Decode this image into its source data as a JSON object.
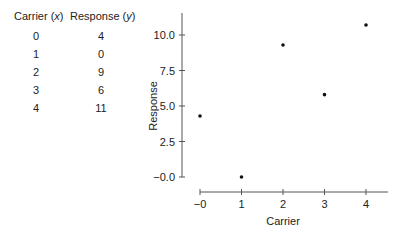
{
  "table": {
    "headers": [
      "Carrier (x)",
      "Response (y)"
    ],
    "header_parts": [
      {
        "label": "Carrier (",
        "var": "x",
        "close": ")"
      },
      {
        "label": "Response (",
        "var": "y",
        "close": ")"
      }
    ],
    "rows": [
      [
        "0",
        "4"
      ],
      [
        "1",
        "0"
      ],
      [
        "2",
        "9"
      ],
      [
        "3",
        "6"
      ],
      [
        "4",
        "11"
      ]
    ]
  },
  "chart_data": {
    "type": "scatter",
    "title": "",
    "xlabel": "Carrier",
    "ylabel": "Response",
    "x": [
      0,
      1,
      2,
      3,
      4
    ],
    "y": [
      4.3,
      0.0,
      9.3,
      5.8,
      10.7
    ],
    "xticks": [
      "−0",
      "1",
      "2",
      "3",
      "4"
    ],
    "yticks": [
      "−0.0",
      "2.5",
      "5.0",
      "7.5",
      "10.0"
    ],
    "xlim": [
      0,
      4.5
    ],
    "ylim": [
      0,
      11.5
    ],
    "grid": false,
    "legend": null
  }
}
